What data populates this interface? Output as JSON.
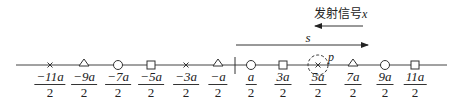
{
  "diagram": {
    "signal_label": "发射信号",
    "signal_var": "x",
    "s_label": "s",
    "p_label": "p",
    "axis": {
      "y": 65,
      "x_start": 16,
      "x_end": 447,
      "origin_tick_x": 235
    },
    "points": [
      {
        "x": 50,
        "marker": "cross",
        "num": "−11a",
        "den": "2"
      },
      {
        "x": 84,
        "marker": "triangle",
        "num": "−9a",
        "den": "2"
      },
      {
        "x": 118,
        "marker": "circle",
        "num": "−7a",
        "den": "2"
      },
      {
        "x": 151,
        "marker": "square",
        "num": "−5a",
        "den": "2"
      },
      {
        "x": 186,
        "marker": "cross",
        "num": "−3a",
        "den": "2"
      },
      {
        "x": 218,
        "marker": "triangle",
        "num": "−a",
        "den": "2"
      },
      {
        "x": 251,
        "marker": "circle",
        "num": "a",
        "den": "2"
      },
      {
        "x": 283,
        "marker": "square",
        "num": "3a",
        "den": "2"
      },
      {
        "x": 318,
        "marker": "cross",
        "num": "5a",
        "den": "2",
        "highlight": true
      },
      {
        "x": 353,
        "marker": "triangle",
        "num": "7a",
        "den": "2"
      },
      {
        "x": 385,
        "marker": "circle",
        "num": "9a",
        "den": "2"
      },
      {
        "x": 415,
        "marker": "square",
        "num": "11a",
        "den": "2"
      }
    ]
  }
}
